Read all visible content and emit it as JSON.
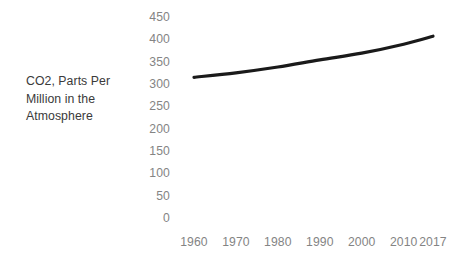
{
  "axis": {
    "y_title": "CO2, Parts Per\nMillion in the\nAtmosphere",
    "y_ticks": [
      "450",
      "400",
      "350",
      "300",
      "250",
      "200",
      "150",
      "100",
      "50",
      "0"
    ],
    "x_ticks": [
      "1960",
      "1970",
      "1980",
      "1990",
      "2000",
      "2010",
      "2017"
    ]
  },
  "style": {
    "line_color": "#1a1a1a",
    "tick_label_color": "#848484",
    "axis_title_color": "#3a3a3a",
    "background": "#ffffff"
  },
  "chart_data": {
    "type": "line",
    "title": "",
    "xlabel": "",
    "ylabel": "CO2, Parts Per Million in the Atmosphere",
    "x": [
      1960,
      1970,
      1980,
      1990,
      2000,
      2010,
      2017
    ],
    "values": [
      315,
      325,
      338,
      354,
      369,
      389,
      407
    ],
    "series": [
      {
        "name": "CO2, Parts Per Million in the Atmosphere",
        "values": [
          315,
          325,
          338,
          354,
          369,
          389,
          407
        ]
      }
    ],
    "xlim": [
      1960,
      2017
    ],
    "ylim": [
      0,
      450
    ],
    "ytick_values": [
      0,
      50,
      100,
      150,
      200,
      250,
      300,
      350,
      400,
      450
    ],
    "xtick_values": [
      1960,
      1970,
      1980,
      1990,
      2000,
      2010,
      2017
    ],
    "grid": false,
    "legend": false,
    "legend_position": "none",
    "annotations": []
  }
}
